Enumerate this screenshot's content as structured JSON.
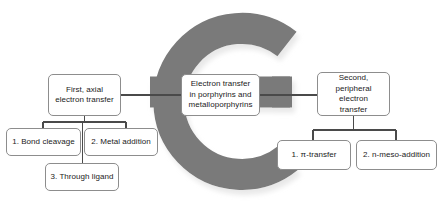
{
  "diagram": {
    "title_letter": "e",
    "letter_color": "#7a7a7a",
    "letter_shadow_color": "#d6d6d6",
    "box_border_color": "#8d8d8d",
    "connector_color": "#4a4a4a",
    "background_color": "#ffffff",
    "center": {
      "label": "Electron transfer in porphyrins and metalloporphyrins",
      "line1": "Electron transfer",
      "line2": "in porphyrins and",
      "line3": "metalloporphyrins"
    },
    "left_branch": {
      "parent": {
        "label": "First, axial electron transfer",
        "line1": "First, axial",
        "line2": "electron transfer"
      },
      "children": [
        {
          "label": "1. Bond cleavage"
        },
        {
          "label": "2. Metal addition"
        },
        {
          "label": "3. Through ligand"
        }
      ]
    },
    "right_branch": {
      "parent": {
        "label": "Second, peripheral electron transfer",
        "line1": "Second,",
        "line2": "peripheral electron",
        "line3": "transfer"
      },
      "children": [
        {
          "label": "1. π-transfer"
        },
        {
          "label": "2. n-meso-addition"
        }
      ]
    }
  }
}
